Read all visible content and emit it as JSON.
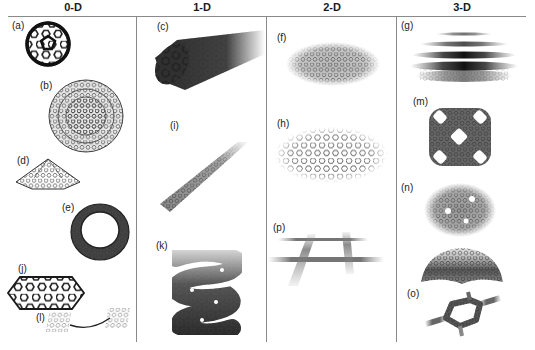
{
  "columns": [
    {
      "title": "0-D",
      "x": 8
    },
    {
      "title": "1-D",
      "x": 137
    },
    {
      "title": "2-D",
      "x": 267
    },
    {
      "title": "3-D",
      "x": 397
    }
  ],
  "panels": [
    {
      "id": "a",
      "label": "(a)",
      "column": "0-D",
      "depicts": "fullerene-cage"
    },
    {
      "id": "b",
      "label": "(b)",
      "column": "0-D",
      "depicts": "multi-shell-onion-sphere"
    },
    {
      "id": "d",
      "label": "(d)",
      "column": "0-D",
      "depicts": "nanocone"
    },
    {
      "id": "e",
      "label": "(e)",
      "column": "0-D",
      "depicts": "nanotorus"
    },
    {
      "id": "j",
      "label": "(j)",
      "column": "0-D",
      "depicts": "graphene-flake"
    },
    {
      "id": "l",
      "label": "(l)",
      "column": "0-D",
      "depicts": "linked-flakes"
    },
    {
      "id": "c",
      "label": "(c)",
      "column": "1-D",
      "depicts": "nanotube"
    },
    {
      "id": "i",
      "label": "(i)",
      "column": "1-D",
      "depicts": "nanoribbon"
    },
    {
      "id": "k",
      "label": "(k)",
      "column": "1-D",
      "depicts": "helical-coil"
    },
    {
      "id": "f",
      "label": "(f)",
      "column": "2-D",
      "depicts": "graphene-sheet"
    },
    {
      "id": "h",
      "label": "(h)",
      "column": "2-D",
      "depicts": "porous-graphene-sheet"
    },
    {
      "id": "p",
      "label": "(p)",
      "column": "2-D",
      "depicts": "ribbon-network"
    },
    {
      "id": "g",
      "label": "(g)",
      "column": "3-D",
      "depicts": "stacked-graphite-layers"
    },
    {
      "id": "m",
      "label": "(m)",
      "column": "3-D",
      "depicts": "schwarzite-framework"
    },
    {
      "id": "n",
      "label": "(n)",
      "column": "3-D",
      "depicts": "defective-sheet-and-dome"
    },
    {
      "id": "o",
      "label": "(o)",
      "column": "3-D",
      "depicts": "hexagonal-pillared-network"
    }
  ],
  "colors": {
    "rule": "#8a8a8a",
    "lattice_dark": "#1e1e1e",
    "lattice_mid": "#555555",
    "lattice_light": "#a0a0a0"
  }
}
